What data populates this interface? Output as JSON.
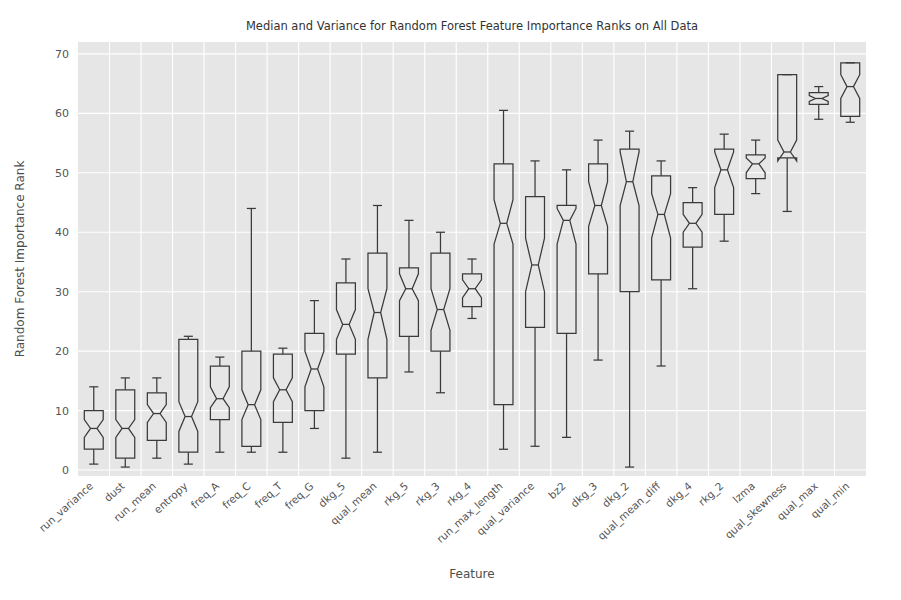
{
  "chart_data": {
    "type": "box",
    "title": "Median and Variance for Random Forest Feature Importance Ranks on All Data",
    "xlabel": "Feature",
    "ylabel": "Random Forest Importance Rank",
    "ylim": [
      -1,
      72
    ],
    "yticks": [
      0,
      10,
      20,
      30,
      40,
      50,
      60,
      70
    ],
    "grid": true,
    "legend": "none",
    "notched": true,
    "categories": [
      "run_variance",
      "dust",
      "run_mean",
      "entropy",
      "freq_A",
      "freq_C",
      "freq_T",
      "freq_G",
      "dkg_5",
      "qual_mean",
      "rkg_5",
      "rkg_3",
      "rkg_4",
      "run_max_length",
      "qual_variance",
      "bz2",
      "dkg_3",
      "dkg_2",
      "qual_mean_diff",
      "dkg_4",
      "rkg_2",
      "lzma",
      "qual_skewness",
      "qual_max",
      "qual_min"
    ],
    "boxes": [
      {
        "label": "run_variance",
        "whisker_low": 1.0,
        "q1": 3.5,
        "median": 7.0,
        "q3": 10.0,
        "whisker_high": 14.0,
        "notch_low": 5.5,
        "notch_high": 8.5
      },
      {
        "label": "dust",
        "whisker_low": 0.5,
        "q1": 2.0,
        "median": 7.0,
        "q3": 13.5,
        "whisker_high": 15.5,
        "notch_low": 5.5,
        "notch_high": 8.5
      },
      {
        "label": "run_mean",
        "whisker_low": 2.0,
        "q1": 5.0,
        "median": 9.5,
        "q3": 13.0,
        "whisker_high": 15.5,
        "notch_low": 8.0,
        "notch_high": 11.0
      },
      {
        "label": "entropy",
        "whisker_low": 1.0,
        "q1": 3.0,
        "median": 9.0,
        "q3": 22.0,
        "whisker_high": 22.5,
        "notch_low": 6.5,
        "notch_high": 11.5
      },
      {
        "label": "freq_A",
        "whisker_low": 3.0,
        "q1": 8.5,
        "median": 12.0,
        "q3": 17.5,
        "whisker_high": 19.0,
        "notch_low": 10.5,
        "notch_high": 14.0
      },
      {
        "label": "freq_C",
        "whisker_low": 3.0,
        "q1": 4.0,
        "median": 11.0,
        "q3": 20.0,
        "whisker_high": 44.0,
        "notch_low": 8.5,
        "notch_high": 13.5
      },
      {
        "label": "freq_T",
        "whisker_low": 3.0,
        "q1": 8.0,
        "median": 13.5,
        "q3": 19.5,
        "whisker_high": 20.5,
        "notch_low": 11.5,
        "notch_high": 15.5
      },
      {
        "label": "freq_G",
        "whisker_low": 7.0,
        "q1": 10.0,
        "median": 17.0,
        "q3": 23.0,
        "whisker_high": 28.5,
        "notch_low": 14.0,
        "notch_high": 20.0
      },
      {
        "label": "dkg_5",
        "whisker_low": 2.0,
        "q1": 19.5,
        "median": 24.5,
        "q3": 31.5,
        "whisker_high": 35.5,
        "notch_low": 22.0,
        "notch_high": 27.0
      },
      {
        "label": "qual_mean",
        "whisker_low": 3.0,
        "q1": 15.5,
        "median": 26.5,
        "q3": 36.5,
        "whisker_high": 44.5,
        "notch_low": 22.0,
        "notch_high": 30.5
      },
      {
        "label": "rkg_5",
        "whisker_low": 16.5,
        "q1": 22.5,
        "median": 30.5,
        "q3": 34.0,
        "whisker_high": 42.0,
        "notch_low": 28.5,
        "notch_high": 33.0
      },
      {
        "label": "rkg_3",
        "whisker_low": 13.0,
        "q1": 20.0,
        "median": 27.0,
        "q3": 36.5,
        "whisker_high": 40.0,
        "notch_low": 23.5,
        "notch_high": 30.5
      },
      {
        "label": "rkg_4",
        "whisker_low": 25.5,
        "q1": 27.5,
        "median": 30.5,
        "q3": 33.0,
        "whisker_high": 35.5,
        "notch_low": 29.0,
        "notch_high": 32.0
      },
      {
        "label": "run_max_length",
        "whisker_low": 3.5,
        "q1": 11.0,
        "median": 41.5,
        "q3": 51.5,
        "whisker_high": 60.5,
        "notch_low": 38.0,
        "notch_high": 45.5
      },
      {
        "label": "qual_variance",
        "whisker_low": 4.0,
        "q1": 24.0,
        "median": 34.5,
        "q3": 46.0,
        "whisker_high": 52.0,
        "notch_low": 30.0,
        "notch_high": 39.0
      },
      {
        "label": "bz2",
        "whisker_low": 5.5,
        "q1": 23.0,
        "median": 42.0,
        "q3": 44.5,
        "whisker_high": 50.5,
        "notch_low": 38.0,
        "notch_high": 44.0
      },
      {
        "label": "dkg_3",
        "whisker_low": 18.5,
        "q1": 33.0,
        "median": 44.5,
        "q3": 51.5,
        "whisker_high": 55.5,
        "notch_low": 41.0,
        "notch_high": 48.5
      },
      {
        "label": "dkg_2",
        "whisker_low": 0.5,
        "q1": 30.0,
        "median": 48.5,
        "q3": 54.0,
        "whisker_high": 57.0,
        "notch_low": 44.5,
        "notch_high": 53.5
      },
      {
        "label": "qual_mean_diff",
        "whisker_low": 17.5,
        "q1": 32.0,
        "median": 43.0,
        "q3": 49.5,
        "whisker_high": 52.0,
        "notch_low": 39.0,
        "notch_high": 46.5
      },
      {
        "label": "dkg_4",
        "whisker_low": 30.5,
        "q1": 37.5,
        "median": 41.5,
        "q3": 45.0,
        "whisker_high": 47.5,
        "notch_low": 40.0,
        "notch_high": 43.0
      },
      {
        "label": "rkg_2",
        "whisker_low": 38.5,
        "q1": 43.0,
        "median": 50.5,
        "q3": 54.0,
        "whisker_high": 56.5,
        "notch_low": 47.5,
        "notch_high": 53.5
      },
      {
        "label": "lzma",
        "whisker_low": 46.5,
        "q1": 49.0,
        "median": 51.5,
        "q3": 53.0,
        "whisker_high": 55.5,
        "notch_low": 50.0,
        "notch_high": 52.5
      },
      {
        "label": "qual_skewness",
        "whisker_low": 43.5,
        "q1": 52.5,
        "median": 53.5,
        "q3": 66.5,
        "whisker_high": 66.5,
        "notch_low": 52.0,
        "notch_high": 55.5
      },
      {
        "label": "qual_max",
        "whisker_low": 59.0,
        "q1": 61.5,
        "median": 62.5,
        "q3": 63.5,
        "whisker_high": 64.5,
        "notch_low": 62.0,
        "notch_high": 63.0
      },
      {
        "label": "qual_min",
        "whisker_low": 58.5,
        "q1": 59.5,
        "median": 64.5,
        "q3": 68.5,
        "whisker_high": 68.5,
        "notch_low": 62.5,
        "notch_high": 66.5
      }
    ],
    "colors": {
      "plot_background": "#e6e6e6",
      "gridline": "#ffffff",
      "box_stroke": "#3a3a3a",
      "figure_background": "#ffffff",
      "tick_label": "#555555",
      "title": "#333333"
    }
  }
}
